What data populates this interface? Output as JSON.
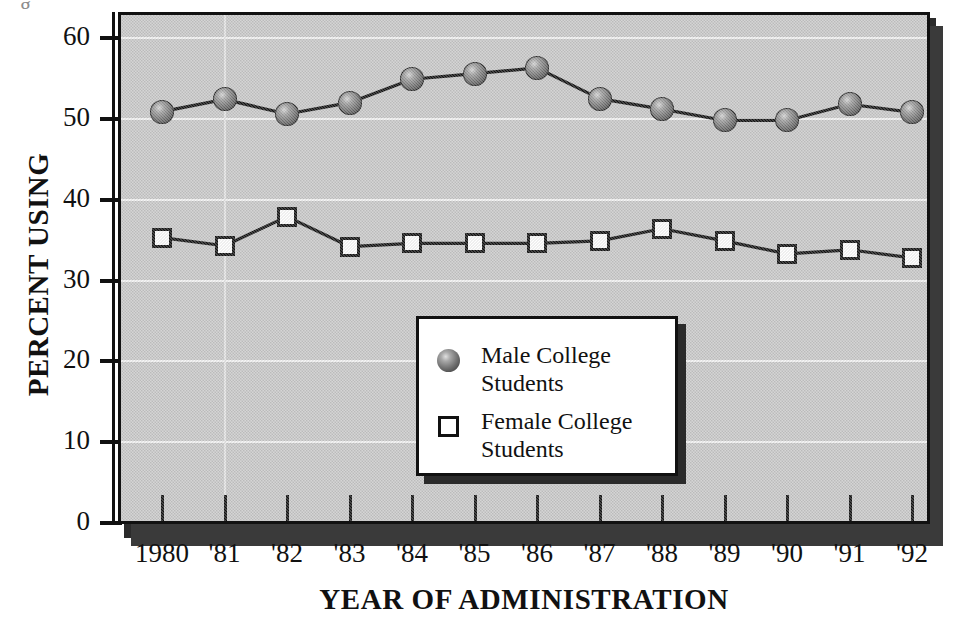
{
  "chart_data": {
    "type": "line",
    "title": "",
    "xlabel": "YEAR OF ADMINISTRATION",
    "ylabel": "PERCENT USING",
    "categories": [
      "1980",
      "'81",
      "'82",
      "'83",
      "'84",
      "'85",
      "'86",
      "'87",
      "'88",
      "'89",
      "'90",
      "'91",
      "'92"
    ],
    "x_values": [
      1980,
      1981,
      1982,
      1983,
      1984,
      1985,
      1986,
      1987,
      1988,
      1989,
      1990,
      1991,
      1992
    ],
    "ylim": [
      0,
      62
    ],
    "yticks": [
      0,
      10,
      20,
      30,
      40,
      50,
      60
    ],
    "ytick_labels": [
      "0",
      "10",
      "20",
      "30",
      "40",
      "50",
      "60"
    ],
    "grid": "horizontal",
    "legend_position": "inside-center",
    "series": [
      {
        "name": "Male College Students",
        "marker": "sphere",
        "color": "#5a5a5a",
        "values": [
          50.9,
          52.4,
          50.6,
          52.0,
          54.9,
          55.6,
          56.3,
          52.5,
          51.2,
          49.8,
          49.8,
          51.8,
          50.8
        ]
      },
      {
        "name": "Female College Students",
        "marker": "open-square",
        "color": "#ffffff",
        "values": [
          35.3,
          34.3,
          37.9,
          34.2,
          34.6,
          34.6,
          34.6,
          34.9,
          36.4,
          34.9,
          33.3,
          33.8,
          32.8
        ]
      }
    ]
  },
  "axes": {
    "y_title": "PERCENT USING",
    "x_title": "YEAR OF ADMINISTRATION",
    "y_tick_labels": [
      "60",
      "50",
      "40",
      "30",
      "20",
      "10",
      "0"
    ],
    "x_tick_labels": [
      "1980",
      "'81",
      "'82",
      "'83",
      "'84",
      "'85",
      "'86",
      "'87",
      "'88",
      "'89",
      "'90",
      "'91",
      "'92"
    ]
  },
  "legend": {
    "items": [
      {
        "label_line1": "Male College",
        "label_line2": "Students",
        "marker": "sphere"
      },
      {
        "label_line1": "Female College",
        "label_line2": "Students",
        "marker": "open-square"
      }
    ]
  },
  "colors": {
    "panel": "#c9c9c9",
    "frame": "#111111",
    "gridline": "#f4f4f4",
    "shadow": "#2b2b2b",
    "ink": "#111111"
  }
}
